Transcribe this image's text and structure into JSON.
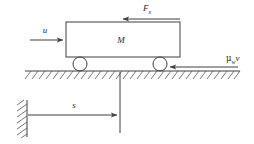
{
  "figure": {
    "type": "free-body-diagram",
    "background_color": "#ffffff",
    "line_color": "#3f3f3f",
    "label_color": "#2b2b2b"
  },
  "labels": {
    "input_force": "u",
    "mass": "M",
    "applied_force_base": "F",
    "applied_force_sub": "x",
    "friction_greek": "μ",
    "friction_sub": "w",
    "friction_velocity": "v",
    "displacement": "s"
  },
  "elements": {
    "cart_body": "cart-rectangle",
    "wheel_left": "wheel-left",
    "wheel_right": "wheel-right",
    "ground": "ground-line-hatched",
    "wall": "fixed-wall-hatched",
    "reference_line": "vertical-reference-line",
    "arrow_input": "arrow-u-right",
    "arrow_force_x": "arrow-Fx-left",
    "arrow_friction": "arrow-muwv-left",
    "arrow_displacement": "arrow-s-right"
  },
  "geometry": {
    "cart": {
      "x": 66,
      "y": 22,
      "width": 114,
      "height": 35
    },
    "wheel_left": {
      "cx": 80,
      "cy": 64,
      "r": 7
    },
    "wheel_right": {
      "cx": 160,
      "cy": 64,
      "r": 7
    },
    "ground_line": {
      "x1": 25,
      "y1": 71,
      "x2": 240,
      "y2": 71
    },
    "wall_line": {
      "x": 27,
      "y1": 100,
      "y2": 137
    },
    "reference_line": {
      "x": 120,
      "y1": 72,
      "y2": 133
    }
  }
}
